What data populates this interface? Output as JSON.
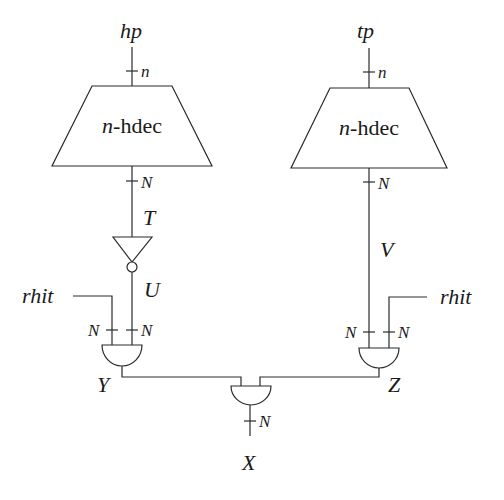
{
  "diagram": {
    "inputs": {
      "left": "hp",
      "right": "tp"
    },
    "decoders": {
      "left": {
        "prefix": "n",
        "suffix": "-hdec"
      },
      "right": {
        "prefix": "n",
        "suffix": "-hdec"
      }
    },
    "bus_widths": {
      "decoder_in_left": "n",
      "decoder_in_right": "n",
      "decoder_out_left": "N",
      "decoder_out_right": "N",
      "gate_y_in_left": "N",
      "gate_y_in_right": "N",
      "gate_z_in_left": "N",
      "gate_z_in_right": "N",
      "output_x": "N"
    },
    "signals": {
      "T": "T",
      "U": "U",
      "V": "V",
      "Y": "Y",
      "Z": "Z",
      "X": "X",
      "rhit_left": "rhit",
      "rhit_right": "rhit"
    },
    "colors": {
      "line": "#2a2a2a",
      "background": "#ffffff"
    }
  }
}
